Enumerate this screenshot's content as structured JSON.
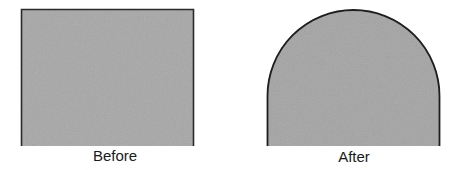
{
  "diagram": {
    "panels": [
      {
        "label": "Before",
        "shape": "rectangle",
        "fill": "#a7a7a7",
        "stroke": "#2a2a2a"
      },
      {
        "label": "After",
        "shape": "rectangle-with-semicircular-top",
        "fill": "#a4a4a4",
        "stroke": "#1e1e1e"
      }
    ]
  }
}
